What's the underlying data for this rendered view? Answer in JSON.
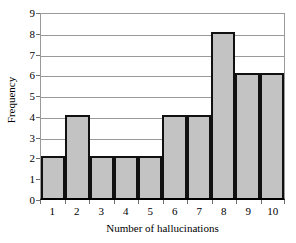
{
  "chart_data": {
    "type": "bar",
    "title": "",
    "xlabel": "Number of hallucinations",
    "ylabel": "Frequency",
    "categories": [
      "1",
      "2",
      "3",
      "4",
      "5",
      "6",
      "7",
      "8",
      "9",
      "10"
    ],
    "values": [
      2,
      4,
      2,
      2,
      2,
      4,
      4,
      8,
      6,
      6
    ],
    "ylim": [
      0,
      9
    ],
    "ytick_labels": [
      "0",
      "1",
      "2",
      "3",
      "4",
      "5",
      "6",
      "7",
      "8",
      "9"
    ],
    "ytick_values": [
      0,
      1,
      2,
      3,
      4,
      5,
      6,
      7,
      8,
      9
    ],
    "grid": true,
    "legend": false,
    "colors": {
      "bar_fill": "#c3c3c3",
      "bar_border": "#111111",
      "gridline": "#9a9a9a",
      "axis": "#000000",
      "background": "#ffffff",
      "text": "#000000"
    }
  }
}
